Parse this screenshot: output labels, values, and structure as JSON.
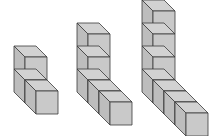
{
  "diagram": {
    "title": "",
    "colors": {
      "background": "#ffffff",
      "front_face": "#c9c9c9",
      "side_face": "#bdbdbd",
      "top_face": "#d2d2d2",
      "edge": "#3a3a3a"
    },
    "cube": {
      "width": 22,
      "height": 23,
      "depth_dx": -11,
      "depth_dy": -11
    },
    "figures": [
      {
        "name": "figure-1",
        "tower_height": 2,
        "arm_length": 1,
        "origin": {
          "x": 25,
          "y": 80
        }
      },
      {
        "name": "figure-2",
        "tower_height": 3,
        "arm_length": 2,
        "origin": {
          "x": 88,
          "y": 80
        }
      },
      {
        "name": "figure-3",
        "tower_height": 4,
        "arm_length": 3,
        "origin": {
          "x": 153,
          "y": 80
        }
      }
    ]
  }
}
